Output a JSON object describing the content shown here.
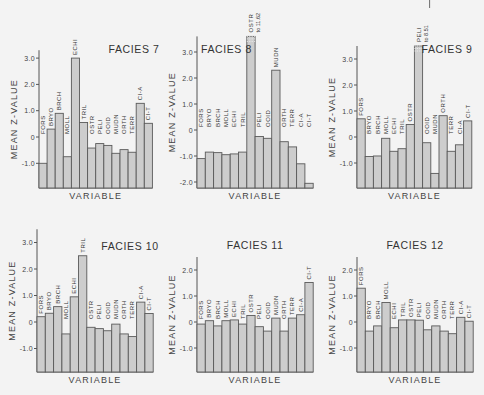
{
  "chart_data": [
    {
      "type": "bar",
      "title": "FACIES 7",
      "xlabel": "VARIABLE",
      "ylabel": "MEAN Z-VALUE",
      "ylim": [
        -1.9,
        3.3
      ],
      "yticks": [
        -1.0,
        0,
        1.0,
        2.0,
        3.0
      ],
      "ytick_labels": [
        "-1.0",
        "0",
        "1.0",
        "2.0",
        "3.0"
      ],
      "title_position": "top-right",
      "categories": [
        "FORS",
        "BRYO",
        "BRCH",
        "MOLL",
        "ECHI",
        "TRIL",
        "OSTR",
        "PELI",
        "OOID",
        "MUDN",
        "ORTH",
        "TERR",
        "CI-A",
        "CI-T"
      ],
      "values": [
        -1.0,
        0.3,
        0.9,
        -0.75,
        3.0,
        0.55,
        -0.42,
        -0.25,
        -0.32,
        -0.62,
        -0.48,
        -0.58,
        1.28,
        0.52
      ],
      "annotations": []
    },
    {
      "type": "bar",
      "title": "FACIES 8",
      "xlabel": "VARIABLE",
      "ylabel": "MEAN Z-VALUE",
      "ylim": [
        -2.2,
        3.6
      ],
      "yticks": [
        -2.0,
        -1.0,
        0,
        1.0,
        2.0,
        3.0
      ],
      "ytick_labels": [
        "-2.0",
        "-1.0",
        "0",
        "1.0",
        "2.0",
        "3.0"
      ],
      "title_position": "top-left",
      "categories": [
        "FORS",
        "BRYO",
        "BRCH",
        "MOLL",
        "ECHI",
        "TRIL",
        "OSTR",
        "PELI",
        "OOID",
        "MUDN",
        "ORTH",
        "TERR",
        "CI-A",
        "CI-T"
      ],
      "values": [
        -1.1,
        -0.85,
        -0.87,
        -0.95,
        -0.92,
        -0.85,
        11.62,
        -0.25,
        -0.32,
        2.3,
        -0.45,
        -0.65,
        -1.3,
        -2.05
      ],
      "annotations": [
        {
          "category": "OSTR",
          "text": "to 11.62",
          "truncated": true
        }
      ]
    },
    {
      "type": "bar",
      "title": "FACIES 9",
      "xlabel": "VARIABLE",
      "ylabel": "MEAN Z-VALUE",
      "ylim": [
        -1.9,
        3.5
      ],
      "yticks": [
        -1.0,
        0,
        1.0,
        2.0,
        3.0
      ],
      "ytick_labels": [
        "-1.0",
        "0",
        "1.0",
        "2.0",
        "3.0"
      ],
      "title_position": "top-right",
      "categories": [
        "FORS",
        "BRYO",
        "BRCH",
        "MOLL",
        "ECHI",
        "TRIL",
        "OSTR",
        "PELI",
        "OOID",
        "MUDN",
        "ORTH",
        "TERR",
        "CI-A",
        "CI-T"
      ],
      "values": [
        0.7,
        -0.75,
        -0.73,
        -0.05,
        -0.55,
        -0.45,
        0.48,
        8.51,
        -0.22,
        -1.4,
        0.82,
        -0.55,
        -0.3,
        0.62
      ],
      "annotations": [
        {
          "category": "PELI",
          "text": "to 8.51",
          "truncated": true
        }
      ]
    },
    {
      "type": "bar",
      "title": "FACIES 10",
      "xlabel": "VARIABLE",
      "ylabel": "MEAN Z-VALUE",
      "ylim": [
        -1.9,
        3.5
      ],
      "yticks": [
        -1.0,
        0,
        1.0,
        2.0,
        3.0
      ],
      "ytick_labels": [
        "-1.0",
        "0",
        "1.0",
        "2.0",
        "3.0"
      ],
      "title_position": "top-right",
      "categories": [
        "FORS",
        "BRYO",
        "BRCH",
        "MOLL",
        "ECHI",
        "TRIL",
        "OSTR",
        "PELI",
        "OOID",
        "MUDN",
        "ORTH",
        "TERR",
        "CI-A",
        "CI-T"
      ],
      "values": [
        0.2,
        0.33,
        0.58,
        -0.45,
        0.95,
        2.5,
        -0.2,
        -0.25,
        -0.33,
        -0.08,
        -0.45,
        -0.55,
        0.75,
        0.32
      ],
      "annotations": []
    },
    {
      "type": "bar",
      "title": "FACIES 11",
      "xlabel": "VARIABLE",
      "ylabel": "MEAN Z-VALUE",
      "ylim": [
        -1.9,
        2.5
      ],
      "yticks": [
        -1.0,
        0,
        1.0,
        2.0
      ],
      "ytick_labels": [
        "-1.0",
        "0",
        "1.0",
        "2.0"
      ],
      "title_position": "top-center",
      "categories": [
        "FORS",
        "BRYO",
        "BRCH",
        "MOLL",
        "ECHI",
        "TRIL",
        "OSTR",
        "PELI",
        "OOID",
        "MUDN",
        "ORTH",
        "TERR",
        "CI-A",
        "CI-T"
      ],
      "values": [
        -0.08,
        0.05,
        -0.15,
        0.05,
        0.08,
        -0.08,
        0.25,
        -0.18,
        -0.35,
        0.15,
        -0.35,
        0.15,
        0.28,
        1.52
      ],
      "annotations": []
    },
    {
      "type": "bar",
      "title": "FACIES 12",
      "xlabel": "VARIABLE",
      "ylabel": "MEAN Z-VALUE",
      "ylim": [
        -1.9,
        2.5
      ],
      "yticks": [
        -1.0,
        0,
        1.0,
        2.0
      ],
      "ytick_labels": [
        "-1.0",
        "0",
        "1.0",
        "2.0"
      ],
      "title_position": "top-center",
      "categories": [
        "FORS",
        "BRYO",
        "BRCH",
        "MOLL",
        "ECHI",
        "TRIL",
        "OSTR",
        "PELI",
        "OOID",
        "MUDN",
        "ORTH",
        "TERR",
        "CI-A",
        "CI-T"
      ],
      "values": [
        1.3,
        -0.35,
        -0.15,
        0.75,
        -0.22,
        0.08,
        0.08,
        0.07,
        -0.3,
        -0.15,
        -0.35,
        -0.45,
        0.18,
        0.03
      ],
      "annotations": []
    }
  ]
}
